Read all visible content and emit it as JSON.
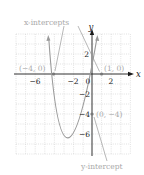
{
  "figure": {
    "type": "parabola-graph",
    "equation_implied": "y = x^2 + 3x - 4",
    "axes": {
      "x_label": "x",
      "y_label": "y",
      "x_ticks": [
        {
          "value": -6,
          "label": "−6"
        },
        {
          "value": -2,
          "label": "−2"
        },
        {
          "value": 0,
          "label": "0"
        },
        {
          "value": 2,
          "label": "2"
        }
      ],
      "y_ticks": [
        {
          "value": 2,
          "label": "2"
        },
        {
          "value": -2,
          "label": "−2"
        },
        {
          "value": -4,
          "label": "−4"
        },
        {
          "value": -6,
          "label": "−6"
        }
      ],
      "x_range": [
        -8,
        4
      ],
      "y_range": [
        -8,
        4
      ],
      "grid": "dotted"
    },
    "points": [
      {
        "name": "x-intercept-left",
        "label": "(−4, 0)",
        "x": -4,
        "y": 0
      },
      {
        "name": "x-intercept-right",
        "label": "(1, 0)",
        "x": 1,
        "y": 0
      },
      {
        "name": "y-intercept",
        "label": "(0, −4)",
        "x": 0,
        "y": -4
      }
    ],
    "annotations": {
      "x_intercepts": "x-intercepts",
      "y_intercept": "y-intercept"
    },
    "colors": {
      "curve": "#9a9a9a",
      "axis": "#1a1a1a",
      "grid": "#c8c8c8",
      "annotation_text": "#a8a8a8",
      "point": "#777777"
    }
  }
}
